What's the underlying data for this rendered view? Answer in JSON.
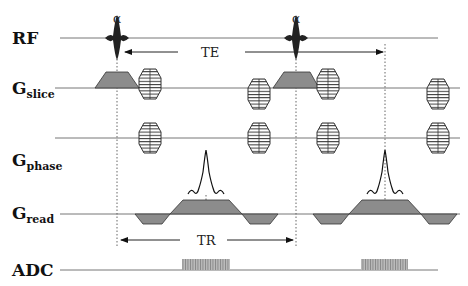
{
  "diagram": {
    "type": "MRI gradient echo pulse sequence",
    "rows": [
      {
        "id": "rf",
        "label": "RF",
        "sub": ""
      },
      {
        "id": "slice",
        "label": "G",
        "sub": "slice"
      },
      {
        "id": "phase",
        "label": "G",
        "sub": "phase"
      },
      {
        "id": "read",
        "label": "G",
        "sub": "read"
      },
      {
        "id": "adc",
        "label": "ADC",
        "sub": ""
      }
    ],
    "annotations": {
      "flip_angle_1": "α",
      "flip_angle_2": "α",
      "echo_time": "TE",
      "repetition_time": "TR"
    },
    "colors": {
      "line": "#777777",
      "fill": "#8c8c8c",
      "stroke": "#333333",
      "adc": "#999999"
    }
  }
}
